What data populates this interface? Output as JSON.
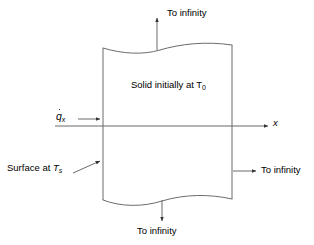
{
  "diagram": {
    "type": "schematic",
    "background_color": "#ffffff",
    "line_color": "#555555",
    "arrow_color": "#333333",
    "text_color": "#000000",
    "body": {
      "name": "solid-body",
      "left_edge_x": 103,
      "right_edge_x": 232,
      "top_edge_y": 48,
      "bottom_edge_y": 200,
      "top_boundary": "wavy",
      "bottom_boundary": "wavy",
      "fill": "none"
    },
    "labels": {
      "solid_interior": {
        "text_before": "Solid initially at T",
        "subscript": "0",
        "full_text": "Solid initially at T0"
      },
      "heat_flux": {
        "symbol": "q",
        "has_dot_accent": true,
        "subscript": "x",
        "full_text": "q̇x"
      },
      "surface": {
        "text_before": "Surface at ",
        "symbol": "T",
        "subscript": "s",
        "full_text": "Surface at Ts"
      },
      "axis_x": {
        "text": "x"
      },
      "to_infinity_top": {
        "text": "To infinity"
      },
      "to_infinity_bottom": {
        "text": "To infinity"
      },
      "to_infinity_right": {
        "text": "To infinity"
      }
    },
    "arrows": [
      {
        "name": "arrow-to-infinity-top",
        "direction": "up",
        "x1": 157,
        "y1": 48,
        "x2": 157,
        "y2": 16
      },
      {
        "name": "arrow-to-infinity-bottom",
        "direction": "down",
        "x1": 162,
        "y1": 199,
        "x2": 162,
        "y2": 223
      },
      {
        "name": "arrow-to-infinity-right",
        "direction": "right",
        "x1": 233,
        "y1": 171,
        "x2": 258,
        "y2": 171
      },
      {
        "name": "arrow-heat-flux",
        "direction": "right",
        "x1": 78,
        "y1": 119,
        "x2": 102,
        "y2": 119
      },
      {
        "name": "arrow-surface-leader",
        "direction": "up-right",
        "x1": 75,
        "y1": 172,
        "x2": 102,
        "y2": 161
      },
      {
        "name": "arrow-x-axis",
        "direction": "right",
        "x1": 55,
        "y1": 126,
        "x2": 270,
        "y2": 126
      }
    ]
  }
}
